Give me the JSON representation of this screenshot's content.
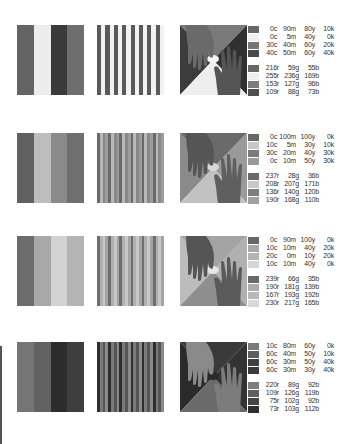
{
  "rows": [
    {
      "bands": [
        "#646464",
        "#ececec",
        "#3a3a3a",
        "#6e6e6e"
      ],
      "stripes": [
        "#5a5a5a",
        "#f2f2f2"
      ],
      "hands": {
        "bg_top": "#7a7a7a",
        "bg_left": "#3c3c3c",
        "bg_right": "#303030",
        "bg_bottom": "#eeeeee",
        "hand_a": "#6a6a6a",
        "hand_b": "#555555",
        "glow": "#f4f4f4"
      },
      "cmyk": [
        {
          "color": "#686868",
          "c": "0c",
          "m": "90m",
          "y": "80y",
          "k": "10k"
        },
        {
          "color": "#efefef",
          "c": "0c",
          "m": "5m",
          "y": "40y",
          "k": "0k"
        },
        {
          "color": "#777777",
          "c": "30c",
          "m": "40m",
          "y": "60y",
          "k": "20k"
        },
        {
          "color": "#4a4a4a",
          "c": "40c",
          "m": "50m",
          "y": "60y",
          "k": "40k"
        }
      ],
      "rgb": [
        {
          "color": "#676767",
          "r": "216r",
          "g": "59g",
          "b": "55b"
        },
        {
          "color": "#efefef",
          "r": "255r",
          "g": "236g",
          "b": "169b"
        },
        {
          "color": "#7c7c7c",
          "r": "153r",
          "g": "127g",
          "b": "96b"
        },
        {
          "color": "#4f4f4f",
          "r": "109r",
          "g": "88g",
          "b": "73b"
        }
      ]
    },
    {
      "bands": [
        "#606060",
        "#bdbdbd",
        "#8a8a8a",
        "#6f6f6f"
      ],
      "stripes": [
        "#6a6a6a",
        "#b8b8b8",
        "#888888",
        "#9c9c9c"
      ],
      "hands": {
        "bg_top": "#6a6a6a",
        "bg_left": "#8a8a8a",
        "bg_right": "#9a9a9a",
        "bg_bottom": "#c2c2c2",
        "hand_a": "#555555",
        "hand_b": "#5f5f5f",
        "glow": "#d8d8d8"
      },
      "cmyk": [
        {
          "color": "#666666",
          "c": "0c",
          "m": "100m",
          "y": "100y",
          "k": "0k"
        },
        {
          "color": "#c8c8c8",
          "c": "10c",
          "m": "5m",
          "y": "30y",
          "k": "10k"
        },
        {
          "color": "#7a7a7a",
          "c": "30c",
          "m": "20m",
          "y": "40y",
          "k": "30k"
        },
        {
          "color": "#9a9a9a",
          "c": "0c",
          "m": "10m",
          "y": "50y",
          "k": "30k"
        }
      ],
      "rgb": [
        {
          "color": "#6a6a6a",
          "r": "237r",
          "g": "28g",
          "b": "36b"
        },
        {
          "color": "#c8c8c8",
          "r": "208r",
          "g": "207g",
          "b": "171b"
        },
        {
          "color": "#7e7e7e",
          "r": "136r",
          "g": "140g",
          "b": "120b"
        },
        {
          "color": "#a0a0a0",
          "r": "190r",
          "g": "168g",
          "b": "110b"
        }
      ]
    },
    {
      "bands": [
        "#6c6c6c",
        "#a8a8a8",
        "#d2d2d2",
        "#b4b4b4"
      ],
      "stripes": [
        "#6e6e6e",
        "#b0b0b0",
        "#c8c8c8",
        "#a4a4a4"
      ],
      "hands": {
        "bg_top": "#a4a4a4",
        "bg_left": "#bcbcbc",
        "bg_right": "#b0b0b0",
        "bg_bottom": "#8e8e8e",
        "hand_a": "#555555",
        "hand_b": "#5a5a5a",
        "glow": "#e6e6e6"
      },
      "cmyk": [
        {
          "color": "#686868",
          "c": "0c",
          "m": "90m",
          "y": "100y",
          "k": "0k"
        },
        {
          "color": "#a8a8a8",
          "c": "10c",
          "m": "10m",
          "y": "40y",
          "k": "20k"
        },
        {
          "color": "#b4b4b4",
          "c": "20c",
          "m": "0m",
          "y": "10y",
          "k": "20k"
        },
        {
          "color": "#d6d6d6",
          "c": "10c",
          "m": "10m",
          "y": "40y",
          "k": "0k"
        }
      ],
      "rgb": [
        {
          "color": "#6a6a6a",
          "r": "239r",
          "g": "66g",
          "b": "35b"
        },
        {
          "color": "#acacac",
          "r": "190r",
          "g": "181g",
          "b": "139b"
        },
        {
          "color": "#b8b8b8",
          "r": "167r",
          "g": "193g",
          "b": "192b"
        },
        {
          "color": "#d8d8d8",
          "r": "230r",
          "g": "217g",
          "b": "165b"
        }
      ]
    },
    {
      "bands": [
        "#757575",
        "#626262",
        "#2c2c2c",
        "#3e3e3e"
      ],
      "stripes": [
        "#2e2e2e",
        "#7a7a7a",
        "#555555",
        "#8a8a8a"
      ],
      "hands": {
        "bg_top": "#3a3a3a",
        "bg_left": "#2a2a2a",
        "bg_right": "#333333",
        "bg_bottom": "#6a6a6a",
        "hand_a": "#8a8a8a",
        "hand_b": "#7c7c7c",
        "glow": "#2a2a2a"
      },
      "cmyk": [
        {
          "color": "#7a7a7a",
          "c": "10c",
          "m": "80m",
          "y": "60y",
          "k": "0k"
        },
        {
          "color": "#5e5e5e",
          "c": "60c",
          "m": "40m",
          "y": "50y",
          "k": "10k"
        },
        {
          "color": "#404040",
          "c": "60c",
          "m": "30m",
          "y": "50y",
          "k": "40k"
        },
        {
          "color": "#3a3a3a",
          "c": "60c",
          "m": "30m",
          "y": "30y",
          "k": "40k"
        }
      ],
      "rgb": [
        {
          "color": "#7e7e7e",
          "r": "220r",
          "g": "89g",
          "b": "92b"
        },
        {
          "color": "#606060",
          "r": "109r",
          "g": "126g",
          "b": "119b"
        },
        {
          "color": "#444444",
          "r": "75r",
          "g": "102g",
          "b": "92b"
        },
        {
          "color": "#2e2e2e",
          "r": "73r",
          "g": "103g",
          "b": "112b"
        }
      ]
    }
  ]
}
